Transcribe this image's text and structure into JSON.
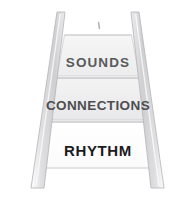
{
  "diagram": {
    "type": "ladder-steps",
    "orientation": "perspective-vertical",
    "background_color": "#ffffff",
    "rail_fill_color": "#e3e3e5",
    "rail_stroke_color": "#b4b4b8",
    "steps": [
      {
        "id": "sounds",
        "label": "SOUNDS",
        "order": 1,
        "position": "top",
        "fill_color": "#f2f2f3",
        "stroke_color": "#cfcfd2",
        "text_color": "#59595b"
      },
      {
        "id": "connections",
        "label": "CONNECTIONS",
        "order": 2,
        "position": "middle",
        "fill_color": "#ededee",
        "stroke_color": "#cacacd",
        "text_color": "#4d4d4f"
      },
      {
        "id": "rhythm",
        "label": "RHYTHM",
        "order": 3,
        "position": "bottom",
        "fill_color": "#fefefe",
        "stroke_color": "#d8d8da",
        "text_color": "#1b1b1d"
      }
    ],
    "marks": [
      {
        "id": "top-speck",
        "shape": "small-tick",
        "color": "#b8b8bb"
      }
    ]
  }
}
